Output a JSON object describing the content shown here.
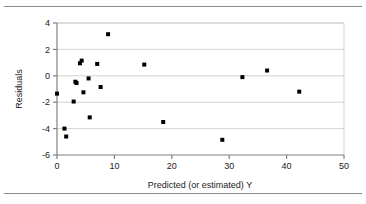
{
  "figure": {
    "background_color": "#ffffff",
    "rule_color": "#8c8c8c",
    "has_top_rule": true,
    "has_bottom_rule": true
  },
  "chart_data": {
    "type": "scatter",
    "title": "",
    "subtitle": "",
    "xlabel": "Predicted (or estimated) Y",
    "ylabel": "Residuals",
    "xlim": [
      0,
      50
    ],
    "ylim": [
      -6,
      4
    ],
    "xticks": [
      0,
      10,
      20,
      30,
      40,
      50
    ],
    "yticks": [
      -6,
      -4,
      -2,
      0,
      2,
      4
    ],
    "xtick_labels": [
      "0",
      "10",
      "20",
      "30",
      "40",
      "50"
    ],
    "ytick_labels": [
      "-6",
      "-4",
      "-2",
      "0",
      "2",
      "4"
    ],
    "grid": "horizontal",
    "grid_color": "#c8c8c8",
    "axis_color": "#808080",
    "legend": null,
    "marker": {
      "shape": "square",
      "color": "#000000",
      "size_px": 4
    },
    "series": [
      {
        "name": "Residuals",
        "x": [
          0.0,
          1.3,
          1.6,
          2.9,
          3.2,
          3.4,
          4.0,
          4.3,
          4.6,
          5.5,
          5.7,
          7.0,
          7.6,
          8.9,
          15.2,
          18.5,
          28.8,
          32.3,
          36.6,
          42.2
        ],
        "y": [
          -1.35,
          -4.0,
          -4.6,
          -1.95,
          -0.45,
          -0.55,
          0.95,
          1.15,
          -1.25,
          -0.2,
          -3.15,
          0.9,
          -0.85,
          3.15,
          0.85,
          -3.5,
          -4.85,
          -0.1,
          0.4,
          -1.2
        ]
      }
    ]
  }
}
